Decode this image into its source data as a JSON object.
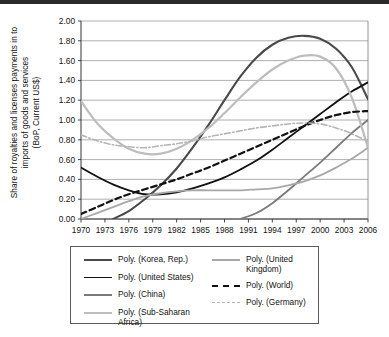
{
  "figure": {
    "y_axis_title": "Share of royalties and licenses payments in to\nimports of goods and services\n(BoP, Current US$)"
  },
  "legend": {
    "items": [
      {
        "label": "Poly. (Korea, Rep.)",
        "color": "#4a4a4a",
        "style": "solid",
        "width": 2.1,
        "column": "left"
      },
      {
        "label": "Poly. (United States)",
        "color": "#111111",
        "style": "solid",
        "width": 1.8,
        "column": "left"
      },
      {
        "label": "Poly. (China)",
        "color": "#7a7a7a",
        "style": "solid",
        "width": 1.8,
        "column": "left"
      },
      {
        "label": "Poly. (Sub-Saharan Africa)",
        "color": "#bdbdbd",
        "style": "solid",
        "width": 2.2,
        "column": "left"
      },
      {
        "label": "Poly. (United Kingdom)",
        "color": "#a8a8a8",
        "style": "solid",
        "width": 1.8,
        "column": "right"
      },
      {
        "label": "Poly. (World)",
        "color": "#111111",
        "style": "dashed",
        "width": 2.2,
        "column": "right"
      },
      {
        "label": "Poly. (Germany)",
        "color": "#b5b5b5",
        "style": "dashdot",
        "width": 1.6,
        "column": "right"
      }
    ]
  },
  "chart_data": {
    "type": "line",
    "title": "",
    "xlabel": "",
    "ylabel": "Share of royalties and licenses payments in to imports of goods and services (BoP, Current US$)",
    "xlim": [
      1970,
      2006
    ],
    "ylim": [
      0.0,
      2.0
    ],
    "yticks": [
      "0.00",
      "0.20",
      "0.40",
      "0.60",
      "0.80",
      "1.00",
      "1.20",
      "1.40",
      "1.60",
      "1.80",
      "2.00"
    ],
    "xticks": [
      1970,
      1973,
      1976,
      1979,
      1982,
      1985,
      1988,
      1991,
      1994,
      1997,
      2000,
      2003,
      2006
    ],
    "grid": "horizontal",
    "legend_position": "below",
    "x": [
      1970,
      1972,
      1974,
      1976,
      1978,
      1980,
      1982,
      1984,
      1986,
      1988,
      1990,
      1992,
      1994,
      1996,
      1998,
      2000,
      2002,
      2004,
      2006
    ],
    "series": [
      {
        "name": "Poly. (Korea, Rep.)",
        "color": "#4a4a4a",
        "style": "solid",
        "width": 2.1,
        "values": [
          null,
          null,
          0.0,
          0.08,
          0.2,
          0.34,
          0.51,
          0.72,
          0.95,
          1.2,
          1.44,
          1.63,
          1.76,
          1.83,
          1.85,
          1.82,
          1.72,
          1.53,
          1.21
        ]
      },
      {
        "name": "Poly. (United States)",
        "color": "#111111",
        "style": "solid",
        "width": 1.8,
        "values": [
          0.52,
          0.43,
          0.35,
          0.29,
          0.25,
          0.25,
          0.27,
          0.31,
          0.36,
          0.42,
          0.5,
          0.59,
          0.7,
          0.82,
          0.94,
          1.06,
          1.18,
          1.29,
          1.38
        ]
      },
      {
        "name": "Poly. (China)",
        "color": "#7a7a7a",
        "style": "solid",
        "width": 1.8,
        "values": [
          null,
          null,
          null,
          null,
          null,
          null,
          null,
          null,
          null,
          null,
          0.0,
          0.06,
          0.16,
          0.29,
          0.43,
          0.57,
          0.72,
          0.87,
          1.0
        ]
      },
      {
        "name": "Poly. (Sub-Saharan Africa)",
        "color": "#bdbdbd",
        "style": "solid",
        "width": 2.2,
        "values": [
          1.19,
          0.97,
          0.82,
          0.71,
          0.66,
          0.66,
          0.71,
          0.8,
          0.92,
          1.07,
          1.23,
          1.38,
          1.51,
          1.6,
          1.65,
          1.64,
          1.52,
          1.22,
          0.72
        ]
      },
      {
        "name": "Poly. (United Kingdom)",
        "color": "#a8a8a8",
        "style": "solid",
        "width": 1.8,
        "values": [
          0.0,
          0.06,
          0.12,
          0.18,
          0.23,
          0.26,
          0.28,
          0.29,
          0.29,
          0.29,
          0.29,
          0.3,
          0.31,
          0.34,
          0.38,
          0.44,
          0.52,
          0.61,
          0.72
        ]
      },
      {
        "name": "Poly. (World)",
        "color": "#111111",
        "style": "dashed",
        "width": 2.2,
        "values": [
          0.05,
          0.12,
          0.19,
          0.25,
          0.3,
          0.35,
          0.4,
          0.46,
          0.52,
          0.59,
          0.66,
          0.73,
          0.8,
          0.87,
          0.94,
          1.0,
          1.05,
          1.08,
          1.09
        ]
      },
      {
        "name": "Poly. (Germany)",
        "color": "#b5b5b5",
        "style": "dashdot",
        "width": 1.6,
        "values": [
          0.85,
          0.79,
          0.75,
          0.73,
          0.72,
          0.74,
          0.76,
          0.79,
          0.83,
          0.86,
          0.89,
          0.92,
          0.94,
          0.96,
          0.97,
          0.96,
          0.92,
          0.86,
          0.78
        ]
      }
    ]
  }
}
